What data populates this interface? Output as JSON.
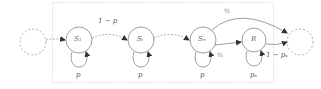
{
  "diagram": {
    "type": "markov-chain",
    "colors": {
      "stroke": "#888888",
      "dashed": "#9a9a9a",
      "frame": "#d8d8d8",
      "text": "#555555"
    },
    "states": [
      {
        "id": "ext-left",
        "label": "",
        "style": "dashed"
      },
      {
        "id": "S1",
        "label": "S",
        "sub": "1",
        "style": "solid"
      },
      {
        "id": "Si",
        "label": "S",
        "sub": "i",
        "style": "solid"
      },
      {
        "id": "Sn",
        "label": "S",
        "sub": "n",
        "style": "solid"
      },
      {
        "id": "R",
        "label": "R",
        "sub": "",
        "style": "solid"
      },
      {
        "id": "ext-right",
        "label": "",
        "style": "dashed"
      }
    ],
    "edges": [
      {
        "from": "ext-left",
        "to": "S1",
        "label": "",
        "style": "dashed"
      },
      {
        "from": "S1",
        "to": "Si",
        "label": "1 − p",
        "style": "dashed"
      },
      {
        "from": "Si",
        "to": "Sn",
        "label": "",
        "style": "dashed"
      },
      {
        "from": "Sn",
        "to": "R",
        "label": "½",
        "style": "solid"
      },
      {
        "from": "Sn",
        "to": "ext-right",
        "label": "½",
        "style": "solid"
      },
      {
        "from": "R",
        "to": "ext-right",
        "label": "1 − pₛ",
        "style": "solid"
      }
    ],
    "self_loops": [
      {
        "state": "S1",
        "label": "p"
      },
      {
        "state": "Si",
        "label": "p"
      },
      {
        "state": "Sn",
        "label": "p"
      },
      {
        "state": "R",
        "label": "pₛ"
      }
    ],
    "labels": {
      "s1": "S₁",
      "si": "Sᵢ",
      "sn": "Sₙ",
      "r": "R",
      "edge_s1_si": "1 − p",
      "edge_sn_right": "½",
      "edge_sn_r": "½",
      "edge_r_right": "1 − pₛ",
      "loop_s1": "p",
      "loop_si": "p",
      "loop_sn": "p",
      "loop_r": "pₛ"
    }
  }
}
